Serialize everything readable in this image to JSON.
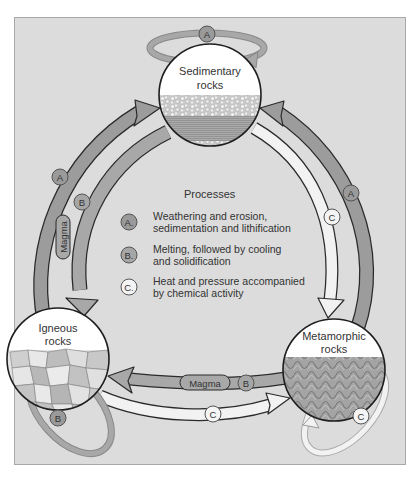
{
  "diagram": {
    "colors": {
      "panel_bg": "#dcdcdc",
      "panel_border": "#a8a8a8",
      "arrow_A": "#9c9c9c",
      "arrow_B": "#a8a8a8",
      "arrow_C": "#f2f2f2",
      "outline": "#2a2a2a",
      "badge_A": "#9a9a9a",
      "badge_B": "#a6a6a6",
      "badge_C": "#f4f4f4"
    },
    "nodes": [
      {
        "id": "sedimentary",
        "label_line1": "Sedimentary",
        "label_line2": "rocks"
      },
      {
        "id": "igneous",
        "label_line1": "Igneous",
        "label_line2": "rocks"
      },
      {
        "id": "metamorphic",
        "label_line1": "Metamorphic",
        "label_line2": "rocks"
      }
    ],
    "edges": [
      {
        "from": "igneous",
        "to": "sedimentary",
        "process": "A"
      },
      {
        "from": "sedimentary",
        "to": "igneous",
        "process": "B",
        "label": "Magma"
      },
      {
        "from": "metamorphic",
        "to": "sedimentary",
        "process": "A"
      },
      {
        "from": "sedimentary",
        "to": "metamorphic",
        "process": "C"
      },
      {
        "from": "metamorphic",
        "to": "igneous",
        "process": "B",
        "label": "Magma"
      },
      {
        "from": "igneous",
        "to": "metamorphic",
        "process": "C"
      },
      {
        "from": "sedimentary",
        "to": "sedimentary",
        "process": "A"
      },
      {
        "from": "igneous",
        "to": "igneous",
        "process": "B"
      },
      {
        "from": "metamorphic",
        "to": "metamorphic",
        "process": "C"
      }
    ],
    "badges": {
      "A": "A",
      "B": "B",
      "C": "C"
    },
    "magma_label": "Magma",
    "legend": {
      "title": "Processes",
      "items": [
        {
          "key": "A.",
          "line1": "Weathering and erosion,",
          "line2": "sedimentation and lithification"
        },
        {
          "key": "B.",
          "line1": "Melting, followed by cooling",
          "line2": "and solidification"
        },
        {
          "key": "C.",
          "line1": "Heat and pressure accompanied",
          "line2": "by chemical activity"
        }
      ]
    }
  }
}
